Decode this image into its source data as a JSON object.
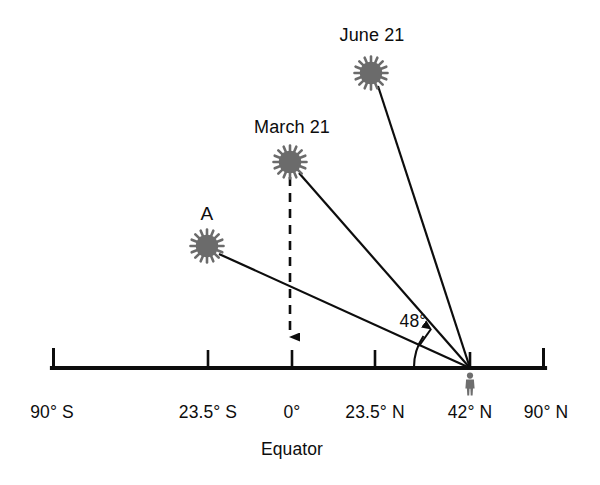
{
  "figure": {
    "kind": "solar-altitude-diagram",
    "colors": {
      "ink": "#0d0d0d",
      "sun_fill": "#6b6b6b",
      "observer_fill": "#6e6e6e",
      "background": "#ffffff"
    }
  },
  "axis": {
    "label_equator": "Equator",
    "ticks": [
      {
        "id": "s90",
        "label": "90° S",
        "x": 52,
        "cap": true
      },
      {
        "id": "s235",
        "label": "23.5° S",
        "x": 208,
        "cap": false
      },
      {
        "id": "eq0",
        "label": "0°",
        "x": 292,
        "cap": false
      },
      {
        "id": "n235",
        "label": "23.5° N",
        "x": 375,
        "cap": false
      },
      {
        "id": "n42",
        "label": "42° N",
        "x": 470,
        "cap": false
      },
      {
        "id": "n90",
        "label": "90° N",
        "x": 545,
        "cap": true
      }
    ]
  },
  "observer": {
    "label": "observer at 42° N",
    "x": 470,
    "y": 368
  },
  "suns": [
    {
      "id": "june21",
      "label": "June 21",
      "cx": 371,
      "cy": 73,
      "label_x": 372,
      "label_y": 35
    },
    {
      "id": "march21",
      "label": "March 21",
      "cx": 290,
      "cy": 162,
      "label_x": 292,
      "label_y": 127
    },
    {
      "id": "sunA",
      "label": "A",
      "cx": 207,
      "cy": 246,
      "label_x": 207,
      "label_y": 214
    }
  ],
  "angle": {
    "label": "48°",
    "value_degrees": 48,
    "measured_from": "horizon at 42° N",
    "measured_to": "March 21 sun ray",
    "label_x": 413,
    "label_y": 321
  },
  "annotations": {
    "vertical_ray_note": "dashed vertical arrow from March 21 sun down to 0° (Equator)"
  }
}
